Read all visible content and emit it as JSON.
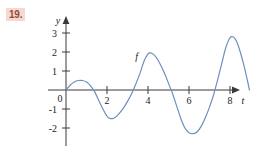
{
  "problem": {
    "number": "19.",
    "badge_bg": "#f4d9d2",
    "badge_fg": "#9a4a32"
  },
  "figure": {
    "curve_color": "#6e8fbe",
    "axis_color": "#3a3a3a",
    "curve_label": "f",
    "x_axis_label": "t",
    "y_axis_label": "y"
  },
  "chart_data": {
    "type": "line",
    "title": "",
    "xlabel": "t",
    "ylabel": "y",
    "series": [
      {
        "name": "f",
        "points": [
          [
            0.0,
            0.0
          ],
          [
            0.2,
            0.25
          ],
          [
            0.4,
            0.42
          ],
          [
            0.6,
            0.5
          ],
          [
            0.8,
            0.5
          ],
          [
            1.0,
            0.42
          ],
          [
            1.2,
            0.22
          ],
          [
            1.4,
            -0.1
          ],
          [
            1.6,
            -0.55
          ],
          [
            1.8,
            -1.0
          ],
          [
            2.0,
            -1.38
          ],
          [
            2.1,
            -1.48
          ],
          [
            2.3,
            -1.5
          ],
          [
            2.5,
            -1.35
          ],
          [
            2.8,
            -0.95
          ],
          [
            3.0,
            -0.6
          ],
          [
            3.2,
            -0.2
          ],
          [
            3.4,
            0.3
          ],
          [
            3.6,
            0.85
          ],
          [
            3.8,
            1.5
          ],
          [
            4.0,
            1.9
          ],
          [
            4.1,
            1.95
          ],
          [
            4.3,
            1.85
          ],
          [
            4.5,
            1.55
          ],
          [
            4.8,
            0.9
          ],
          [
            5.0,
            0.35
          ],
          [
            5.2,
            -0.2
          ],
          [
            5.4,
            -0.85
          ],
          [
            5.6,
            -1.5
          ],
          [
            5.8,
            -2.0
          ],
          [
            6.0,
            -2.25
          ],
          [
            6.2,
            -2.3
          ],
          [
            6.4,
            -2.2
          ],
          [
            6.6,
            -1.9
          ],
          [
            6.8,
            -1.45
          ],
          [
            7.0,
            -0.9
          ],
          [
            7.2,
            -0.25
          ],
          [
            7.4,
            0.55
          ],
          [
            7.6,
            1.4
          ],
          [
            7.8,
            2.25
          ],
          [
            8.0,
            2.75
          ],
          [
            8.15,
            2.8
          ],
          [
            8.3,
            2.6
          ],
          [
            8.5,
            2.0
          ],
          [
            8.7,
            1.2
          ],
          [
            8.85,
            0.5
          ],
          [
            8.95,
            0.0
          ]
        ]
      }
    ],
    "x_ticks": [
      2,
      4,
      6,
      8
    ],
    "x_tick_labels": [
      "2",
      "4",
      "6",
      "8"
    ],
    "y_ticks": [
      3,
      2,
      1,
      -1,
      -2
    ],
    "y_tick_labels": [
      "3",
      "2",
      "1",
      "-1",
      "-2"
    ],
    "origin_label": "0",
    "xlim": [
      -0.5,
      9.6
    ],
    "ylim": [
      -2.9,
      3.5
    ],
    "grid": false,
    "legend": "none",
    "annotations": [
      {
        "text": "f",
        "x": 3.45,
        "y": 1.6
      }
    ]
  }
}
